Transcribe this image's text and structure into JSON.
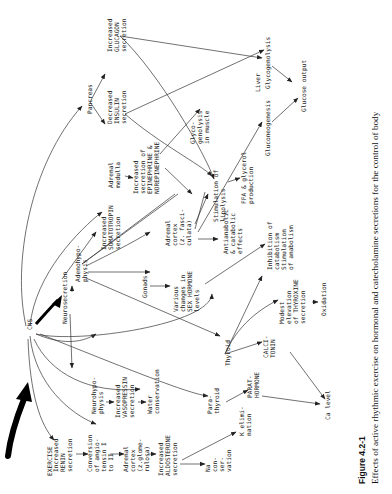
{
  "figure": {
    "label": "Figure 4.2-1",
    "caption": "Effects of active rhythmic exercise on hormonal and catecholamine secretions for the control of body"
  },
  "nodes": {
    "exercise": [
      "EXERCISE"
    ],
    "cns": [
      "CNS"
    ],
    "neurosecretion": [
      "Neurosecretion"
    ],
    "pancreas": [
      "Pancreas"
    ],
    "glucagon": [
      "Increased",
      "GLUCAGON",
      "secretion"
    ],
    "insulin": [
      "Decreased",
      "INSULIN",
      "secretion"
    ],
    "adrenal_medulla": [
      "Adrenal",
      "medulla"
    ],
    "epinephrine": [
      "Increased",
      "secretion of",
      "EPINEPHRINE &",
      "NOREPINEPHRINE"
    ],
    "glycogenolysis_muscle": [
      "Glyco-",
      "genolysis",
      "in muscle"
    ],
    "lipolysis": [
      "Stimulation of",
      "lipolysis"
    ],
    "ffa": [
      "FFA & glycerol",
      "production"
    ],
    "liver": [
      "Liver"
    ],
    "glycogenolysis": [
      "Glycogenolysis"
    ],
    "gluconeogenesis": [
      "Gluconeogenesis"
    ],
    "glucose_output": [
      "Glucose output"
    ],
    "somatotropin": [
      "Increased",
      "SOMATOTROPIN",
      "secretion"
    ],
    "adenohypophysis": [
      "Adenohypo-",
      "physis"
    ],
    "adrenal_cortex_fasc": [
      "Adrenal",
      "cortex",
      "(z. fasci-",
      "culata)"
    ],
    "antianabolic": [
      "Antianabolic",
      "& catabolic",
      "effects"
    ],
    "gonads": [
      "Gonads"
    ],
    "sex_hormone": [
      "Various",
      "changes in",
      "SEX HORMONE",
      "levels"
    ],
    "inhibition": [
      "Inhibition of",
      "catabolism",
      "Stimulation",
      "of anabolism"
    ],
    "thyroid": [
      "Thyroid"
    ],
    "calcitonin": [
      "CALCI-",
      "TONIN"
    ],
    "thyroxine": [
      "Modest",
      "elevation",
      "of THYROXINE",
      "secretion"
    ],
    "oxidation": [
      "Oxidation"
    ],
    "neurohypophysis": [
      "Neurohypo-",
      "physis"
    ],
    "vasopressin": [
      "Increased",
      "VASOPRESSIN",
      "secretion"
    ],
    "water": [
      "Water",
      "conservation"
    ],
    "parathyroid": [
      "Para-",
      "thyroid"
    ],
    "parathormone": [
      "PARAT-",
      "HORMONE"
    ],
    "ca_level": [
      "Ca level"
    ],
    "renin": [
      "Increased",
      "RENIN",
      "secretion"
    ],
    "angiotensin": [
      "Conversion",
      "of angio-",
      "tensin I",
      "to II"
    ],
    "adrenal_cortex_glom": [
      "Adrenal",
      "cortex",
      "(z.glome-",
      "rulosa)"
    ],
    "aldosterone": [
      "Increased",
      "ALDOSTERONE",
      "secretion"
    ],
    "na_conservation": [
      "Na",
      "con-",
      "ser-",
      "vation"
    ],
    "k_elimination": [
      "K elimi-",
      "nation"
    ]
  }
}
